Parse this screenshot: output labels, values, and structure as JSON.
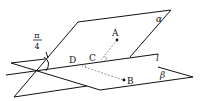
{
  "diagram": {
    "colors": {
      "line": "#111111",
      "dashed": "#888888",
      "background": "#ffffff"
    },
    "planes": [
      {
        "name": "alpha",
        "label": "α"
      },
      {
        "name": "beta",
        "label": "β"
      }
    ],
    "line": {
      "name": "l",
      "label": "l"
    },
    "points": [
      {
        "name": "A",
        "label": "A"
      },
      {
        "name": "B",
        "label": "B"
      },
      {
        "name": "C",
        "label": "C"
      },
      {
        "name": "D",
        "label": "D"
      }
    ],
    "angle": {
      "numerator": "π",
      "denominator": "4"
    }
  }
}
